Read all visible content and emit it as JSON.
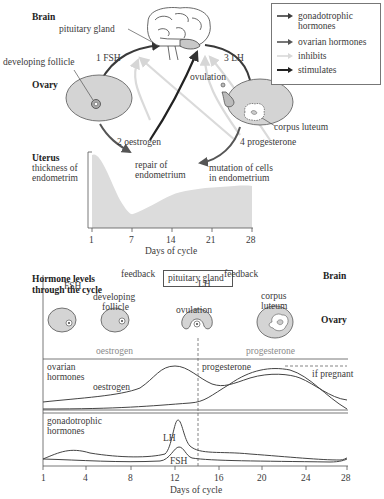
{
  "top_diagram": {
    "brain_label": "Brain",
    "pituitary_label": "pituitary gland",
    "developing_follicle_label": "developing follicle",
    "ovary_label": "Ovary",
    "fsh_label": "1 FSH",
    "lh_label": "3 LH",
    "ovulation_label": "ovulation",
    "corpus_luteum_label": "corpus luteum",
    "oestrogen_label": "2 oestrogen",
    "progesterone_label": "4 progesterone",
    "uterus_label": "Uterus",
    "thickness_label_1": "thickness of",
    "thickness_label_2": "endometrim",
    "repair_label_1": "repair of",
    "repair_label_2": "endometrium",
    "mutation_label_1": "mutation of cells",
    "mutation_label_2": "in endometrium",
    "x_ticks": [
      "1",
      "7",
      "14",
      "21",
      "28"
    ],
    "x_label": "Days of cycle"
  },
  "legend": {
    "items": [
      {
        "label_1": "gonadotrophic",
        "label_2": "hormones",
        "color": "#3d3d3d"
      },
      {
        "label_1": "ovarian hormones",
        "label_2": "",
        "color": "#555555"
      },
      {
        "label_1": "inhibits",
        "label_2": "",
        "color": "#d8d8d8"
      },
      {
        "label_1": "stimulates",
        "label_2": "",
        "color": "#222222"
      }
    ]
  },
  "bottom_diagram": {
    "title_1": "Hormone levels",
    "title_2": "through the cycle",
    "pituitary_box": "pituitary gland",
    "brain_label": "Brain",
    "feedback_1": "feedback",
    "feedback_2": "feedback",
    "fsh_label": "FSH",
    "lh_label": "LH",
    "developing_1": "developing",
    "developing_2": "follicle",
    "ovulation_label": "ovulation",
    "corpus_1": "corpus",
    "corpus_2": "luteum",
    "ovary_label": "Ovary",
    "oestrogen_grey": "oestrogen",
    "progesterone_grey": "progesterone",
    "ovarian_1": "ovarian",
    "ovarian_2": "hormones",
    "oestrogen_curve_label": "oestrogen",
    "progesterone_curve_label": "progesterone",
    "if_pregnant": "if pregnant",
    "gonado_1": "gonadotrophic",
    "gonado_2": "hormones",
    "lh_curve_label": "LH",
    "fsh_curve_label": "FSH",
    "x_ticks": [
      "1",
      "4",
      "8",
      "12",
      "16",
      "20",
      "24",
      "28"
    ],
    "x_label": "Days of cycle"
  },
  "colors": {
    "ovary_fill": "#d4d4d4",
    "uterus_fill": "#dcdcdc",
    "curve": "#444444",
    "inhibit": "#d8d8d8",
    "grey_text": "#8a8a8a"
  }
}
